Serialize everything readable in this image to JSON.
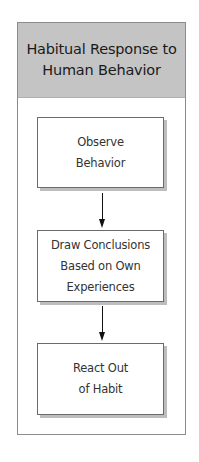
{
  "diagram": {
    "title_lines": [
      "Habitual Response to",
      "Human Behavior"
    ],
    "steps": [
      {
        "lines": [
          "Observe",
          "Behavior"
        ]
      },
      {
        "lines": [
          "Draw Conclusions",
          "Based on Own",
          "Experiences"
        ]
      },
      {
        "lines": [
          "React Out",
          "of Habit"
        ]
      }
    ],
    "colors": {
      "header_bg": "#c4c4c4",
      "border": "#6a6a6a",
      "shadow": "#bdbdbd",
      "arrow": "#111111"
    }
  }
}
